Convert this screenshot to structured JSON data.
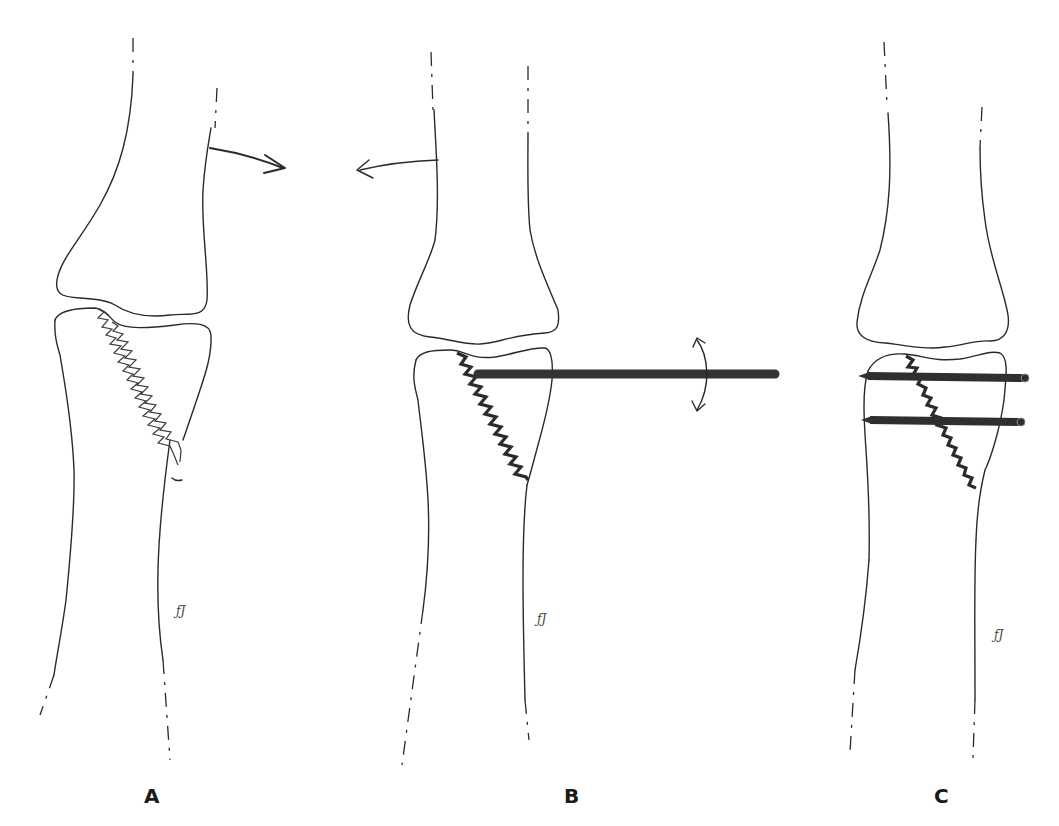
{
  "figure": {
    "panels": [
      {
        "label": "A",
        "content": "Displaced oblique fracture of the proximal bone end, arrow indicating reduction direction",
        "signature": "ƒJ"
      },
      {
        "label": "B",
        "content": "Single horizontal K-wire inserted into fragment with curved rotation arrow; opposing arrow indicating counter movement",
        "signature": "ƒJ"
      },
      {
        "label": "C",
        "content": "Reduced fracture fixed with two parallel K-wires",
        "signature": "ƒJ"
      }
    ]
  },
  "colors": {
    "line": "#2a2a2a",
    "wire": "#333333",
    "background": "#ffffff"
  }
}
